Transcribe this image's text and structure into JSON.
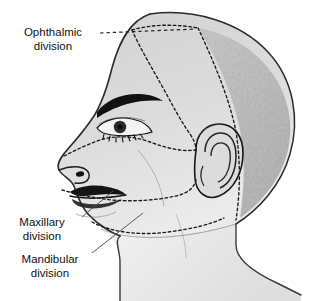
{
  "figure": {
    "view": "lateral head profile, facing left",
    "background_color": "#ffffff"
  },
  "labels": [
    {
      "id": "ophthalmic",
      "line1": "Ophthalmic",
      "line2": "division",
      "leader_style": "dashed",
      "leader_direction": "horizontal-right"
    },
    {
      "id": "maxillary",
      "line1": "Maxillary",
      "line2": "division",
      "leader_style": "solid-thin",
      "leader_direction": "diagonal-up-right"
    },
    {
      "id": "mandibular",
      "line1": "Mandibular",
      "line2": "division",
      "leader_style": "solid-thin",
      "leader_direction": "diagonal-up-right"
    }
  ],
  "colors": {
    "face_upper": "#d6d6d6",
    "face_lower": "#e2e2e2",
    "neck": "#ededed",
    "scalp_hair": "#b9b9b9",
    "outline": "#1a1a1a",
    "boundary_dash": "#1a1a1a",
    "label_text": "#111111",
    "leader_line": "#555555"
  },
  "anatomy": {
    "features": [
      "eyebrow",
      "eye",
      "eyelashes",
      "nose",
      "nostril",
      "lips",
      "chin",
      "ear",
      "jawline",
      "neck",
      "scalp-hair-texture"
    ],
    "boundaries": [
      "ophthalmic-maxillary-boundary",
      "maxillary-mandibular-boundary",
      "hairline-boundary"
    ]
  }
}
